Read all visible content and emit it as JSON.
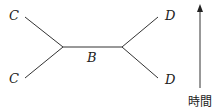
{
  "diagram": {
    "labels": {
      "top_left": "C",
      "bottom_left": "C",
      "center": "B",
      "top_right": "D",
      "bottom_right": "D"
    },
    "arrow_label": "時間",
    "line_color": "#333333"
  }
}
